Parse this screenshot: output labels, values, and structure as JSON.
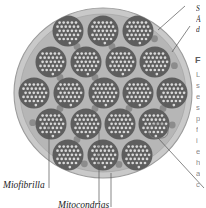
{
  "figure": {
    "name": "muscle-fiber-cross-section",
    "title_visible": false,
    "background_color": "#ffffff",
    "cell": {
      "shape": "circle",
      "center_x": 103,
      "center_y": 93,
      "radius_x": 89,
      "radius_y": 85,
      "membrane_color": "#c9c9c9",
      "membrane_stroke": "#9a9a9a",
      "cytoplasm_color": "#b6b6b6"
    },
    "myofibril": {
      "label": "Miofibrilla",
      "fill_color": "#5e5e5e",
      "filament_dot_color": "#d8d8d8",
      "count": 23,
      "radius": 15.5
    },
    "mitochondria": {
      "label": "Mitocondrias",
      "fill_color": "#8c8c8c",
      "radius": 3.4,
      "count": 28
    },
    "callout_box": {
      "visible": true,
      "x": 149,
      "y": 124,
      "width": 19,
      "height": 14,
      "stroke_color": "#777777"
    }
  },
  "labels": {
    "left": [
      {
        "name": "myofibril",
        "text": "Miofibrilla",
        "x": 3,
        "y": 180
      },
      {
        "name": "mitochondria",
        "text": "Mitocondrias",
        "x": 58,
        "y": 200
      }
    ]
  },
  "leader_lines": [
    {
      "name": "leader-sarcolemma",
      "x1": 185,
      "y1": 6,
      "x2": 158,
      "y2": 30
    },
    {
      "name": "leader-membrane-dot",
      "x1": 190,
      "y1": 26,
      "x2": 172,
      "y2": 52
    },
    {
      "name": "leader-myofibril",
      "x1": 49,
      "y1": 122,
      "x2": 49,
      "y2": 188
    },
    {
      "name": "leader-mitochondria",
      "x1": 99,
      "y1": 132,
      "x2": 99,
      "y2": 204
    },
    {
      "name": "leader-mitochondria-2",
      "x1": 111,
      "y1": 173,
      "x2": 111,
      "y2": 207
    },
    {
      "name": "leader-callout",
      "x1": 158,
      "y1": 138,
      "x2": 204,
      "y2": 188
    }
  ],
  "right_column": {
    "note": "text column clipped at right edge of screenshot",
    "heading_lines": [
      {
        "name": "right-heading-1",
        "text": "S",
        "x": 196,
        "y": 4
      },
      {
        "name": "right-heading-2",
        "text": "Á",
        "x": 196,
        "y": 15
      },
      {
        "name": "right-heading-3",
        "text": "d",
        "x": 196,
        "y": 25
      }
    ],
    "section_heading": {
      "name": "right-section-heading",
      "text": "F",
      "x": 195,
      "y": 55
    },
    "body_lines": [
      {
        "text": "L",
        "x": 196,
        "y": 70
      },
      {
        "text": "s",
        "x": 196,
        "y": 81
      },
      {
        "text": "e",
        "x": 196,
        "y": 92
      },
      {
        "text": "s",
        "x": 196,
        "y": 103
      },
      {
        "text": "p",
        "x": 196,
        "y": 114
      },
      {
        "text": "f",
        "x": 196,
        "y": 125
      },
      {
        "text": "i",
        "x": 196,
        "y": 136
      },
      {
        "text": "e",
        "x": 196,
        "y": 147
      },
      {
        "text": "h",
        "x": 196,
        "y": 158
      },
      {
        "text": "a",
        "x": 196,
        "y": 169
      },
      {
        "text": "c",
        "x": 196,
        "y": 180
      }
    ]
  },
  "colors": {
    "myofibril": "#5e5e5e",
    "mitochondria": "#8c8c8c",
    "cytoplasm": "#b6b6b6",
    "membrane": "#c9c9c9",
    "filament_dot": "#d8d8d8",
    "leader_line": "#555555",
    "label_text": "#1c1c1c"
  }
}
